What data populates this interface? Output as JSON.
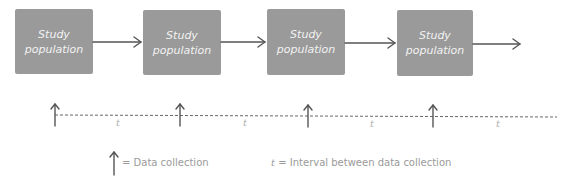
{
  "diagram": {
    "type": "longitudinal-study-timeline",
    "boxes": [
      {
        "line1": "Study",
        "line2": "population"
      },
      {
        "line1": "Study",
        "line2": "population"
      },
      {
        "line1": "Study",
        "line2": "population"
      },
      {
        "line1": "Study",
        "line2": "population"
      }
    ],
    "intervals": [
      "t",
      "t",
      "t",
      "t"
    ],
    "legend": {
      "arrow_label": "= Data collection",
      "t_symbol": "t",
      "t_label": "= Interval between data collection"
    },
    "colors": {
      "box_fill": "#9a9a9a",
      "box_text": "#f2f2f2",
      "arrow": "#555555",
      "dashed_line": "#666666",
      "label_text": "#9a9a9a"
    }
  }
}
